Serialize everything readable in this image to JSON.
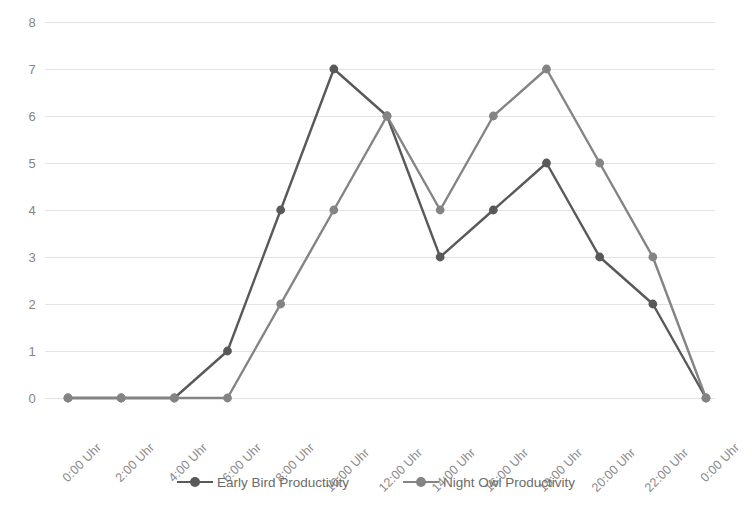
{
  "chart_data": {
    "type": "line",
    "title": "",
    "xlabel": "",
    "ylabel": "",
    "ylim": [
      0,
      8
    ],
    "y_ticks": [
      0,
      1,
      2,
      3,
      4,
      5,
      6,
      7,
      8
    ],
    "grid": true,
    "legend_position": "bottom",
    "categories": [
      "0:00 Uhr",
      "2:00 Uhr",
      "4:00 Uhr",
      "6:00 Uhr",
      "8:00 Uhr",
      "10:00 Uhr",
      "12:00 Uhr",
      "14:00 Uhr",
      "16:00 Uhr",
      "18:00 Uhr",
      "20:00 Uhr",
      "22:00 Uhr",
      "0:00 Uhr"
    ],
    "series": [
      {
        "name": "Early Bird Productivity",
        "color": "#595959",
        "values": [
          0,
          0,
          0,
          1,
          4,
          7,
          6,
          3,
          4,
          5,
          3,
          2,
          0
        ]
      },
      {
        "name": "Night Owl Productivity",
        "color": "#848484",
        "values": [
          0,
          0,
          0,
          0,
          2,
          4,
          6,
          4,
          6,
          7,
          5,
          3,
          0
        ]
      }
    ]
  },
  "axes": {
    "y_tick_labels": [
      "8",
      "7",
      "6",
      "5",
      "4",
      "3",
      "2",
      "1",
      "0"
    ],
    "x_tick_labels": [
      "0:00 Uhr",
      "2:00 Uhr",
      "4:00 Uhr",
      "6:00 Uhr",
      "8:00 Uhr",
      "10:00 Uhr",
      "12:00 Uhr",
      "14:00 Uhr",
      "16:00 Uhr",
      "18:00 Uhr",
      "20:00 Uhr",
      "22:00 Uhr",
      "0:00 Uhr"
    ]
  },
  "legend": {
    "entries": [
      {
        "label": "Early Bird Productivity",
        "color": "#595959"
      },
      {
        "label": "Night Owl Productivity",
        "color": "#848484"
      }
    ]
  },
  "style": {
    "background": "#ffffff",
    "gridline_color": "#e4e4e4",
    "tick_label_color": "#8a8a8a",
    "legend_label_color": "#6b6b6b"
  }
}
